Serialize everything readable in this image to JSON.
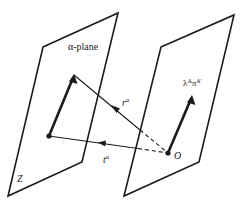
{
  "diagram": {
    "type": "twistor-geometry-figure",
    "stroke_color": "#1a1a1a",
    "background": "#ffffff",
    "planes": [
      {
        "id": "alpha-plane",
        "label_title": "α-plane",
        "label_corner": "Z",
        "corners": [
          [
            43,
            47
          ],
          [
            118,
            13
          ],
          [
            82,
            162
          ],
          [
            8,
            196
          ]
        ]
      },
      {
        "id": "right-plane",
        "corners": [
          [
            161,
            47
          ],
          [
            234,
            15
          ],
          [
            199,
            162
          ],
          [
            124,
            196
          ]
        ]
      }
    ],
    "points": {
      "origin": {
        "label": "O",
        "x": 168,
        "y": 153
      },
      "alpha_point": {
        "x": 49,
        "y": 136
      }
    },
    "vectors": {
      "alpha_thick_arrow": {
        "from": [
          49,
          136
        ],
        "to": [
          74,
          75
        ]
      },
      "lambda_pi_arrow": {
        "from": [
          168,
          153
        ],
        "to": [
          192,
          96
        ],
        "label": "λ",
        "label_sup1": "A",
        "label_mid": "π",
        "label_sup2": "A′"
      },
      "r_line": {
        "from": [
          168,
          153
        ],
        "to": [
          74,
          75
        ],
        "label": "r",
        "label_sup": "a"
      },
      "t_line": {
        "from": [
          168,
          153
        ],
        "to": [
          49,
          136
        ],
        "label": "t",
        "label_sup": "a"
      }
    }
  }
}
